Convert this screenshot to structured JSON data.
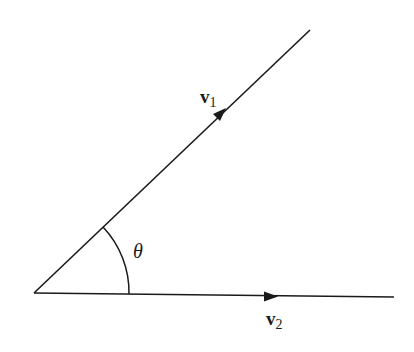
{
  "diagram": {
    "origin": [
      34,
      293
    ],
    "vectors": [
      {
        "name": "v1",
        "label_main": "v",
        "label_sub": "1",
        "end": [
          310,
          30
        ],
        "label_pos": [
          200,
          103
        ]
      },
      {
        "name": "v2",
        "label_main": "v",
        "label_sub": "2",
        "end": [
          394,
          297
        ],
        "label_pos": [
          266,
          325
        ]
      }
    ],
    "angle": {
      "label": "θ",
      "label_pos": [
        133,
        250
      ]
    },
    "colors": {
      "line": "#1a1a1a",
      "background": "#ffffff"
    }
  }
}
